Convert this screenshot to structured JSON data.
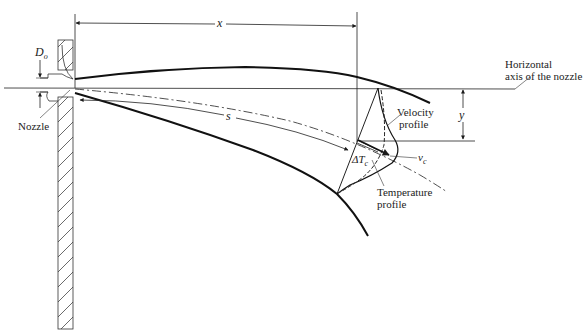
{
  "diagram": {
    "labels": {
      "nozzle_diameter": "D",
      "nozzle_diameter_sub": "o",
      "nozzle": "Nozzle",
      "x": "x",
      "s": "s",
      "y": "y",
      "axis_line1": "Horizontal",
      "axis_line2": "axis of the nozzle",
      "velocity_line1": "Velocity",
      "velocity_line2": "profile",
      "temperature_line1": "Temperature",
      "temperature_line2": "profile",
      "delta_t": "ΔT",
      "delta_t_sub": "c",
      "vc": "v",
      "vc_sub": "c"
    },
    "colors": {
      "line": "#1a1a1a",
      "background": "#ffffff"
    }
  }
}
